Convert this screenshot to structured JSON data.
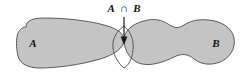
{
  "diagram": {
    "type": "venn-diagram",
    "title": "",
    "background_color": "#ffffff",
    "sets": [
      {
        "id": "A",
        "label": "A",
        "fill_color": "#c4c4c4",
        "stroke_color": "#5a5a5a",
        "label_position": {
          "x": 33,
          "y": 47
        }
      },
      {
        "id": "B",
        "label": "B",
        "fill_color": "#c4c4c4",
        "stroke_color": "#5a5a5a",
        "label_position": {
          "x": 216,
          "y": 47
        }
      }
    ],
    "intersection": {
      "label": "A ∩ B",
      "label_parts": {
        "left": "A",
        "operator": "∩",
        "right": "B"
      },
      "fill_color": "#a0a0a0",
      "stroke_color": "#4a4a4a",
      "label_position": {
        "x": 124,
        "y": 12
      },
      "annotation_arrow": {
        "from": {
          "x": 124,
          "y": 17
        },
        "to": {
          "x": 124,
          "y": 45
        },
        "color": "#1a1a1a",
        "head": "arrow-down"
      }
    }
  }
}
